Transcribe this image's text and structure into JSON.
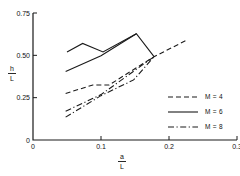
{
  "chart_data": {
    "type": "line",
    "title": "",
    "xlabel": "a/L",
    "ylabel": "h/L",
    "xlabel_num": "a",
    "xlabel_den": "L",
    "ylabel_num": "h",
    "ylabel_den": "L",
    "xlim": [
      0,
      0.3
    ],
    "ylim": [
      0,
      0.75
    ],
    "xticks": [
      0,
      0.1,
      0.2,
      0.3
    ],
    "xticklabels": [
      "0",
      "0.1",
      "0.2",
      "0.3"
    ],
    "yticks": [
      0,
      0.25,
      0.5,
      0.75
    ],
    "yticklabels": [
      "0",
      "0.25",
      "0.50",
      "0.75"
    ],
    "grid": false,
    "legend_position": "lower-right",
    "legend": [
      {
        "label": "M = 4",
        "style": "dashed"
      },
      {
        "label": "M = 6",
        "style": "solid"
      },
      {
        "label": "M = 8",
        "style": "dashdot"
      }
    ],
    "series": [
      {
        "name": "M = 4",
        "style": "dashed",
        "points": [
          [
            0.048,
            0.275
          ],
          [
            0.088,
            0.325
          ],
          [
            0.112,
            0.325
          ],
          [
            0.178,
            0.492
          ],
          [
            0.227,
            0.592
          ]
        ]
      },
      {
        "name": "M = 6 upper",
        "style": "solid",
        "points": [
          [
            0.05,
            0.52
          ],
          [
            0.073,
            0.57
          ],
          [
            0.103,
            0.52
          ],
          [
            0.152,
            0.628
          ],
          [
            0.178,
            0.492
          ]
        ]
      },
      {
        "name": "M = 6 lower",
        "style": "solid",
        "points": [
          [
            0.048,
            0.405
          ],
          [
            0.1,
            0.497
          ],
          [
            0.152,
            0.628
          ]
        ]
      },
      {
        "name": "M = 8 upper",
        "style": "dashdot",
        "points": [
          [
            0.048,
            0.17
          ],
          [
            0.1,
            0.268
          ],
          [
            0.178,
            0.492
          ]
        ]
      },
      {
        "name": "M = 8 lower",
        "style": "dashdot",
        "points": [
          [
            0.048,
            0.135
          ],
          [
            0.1,
            0.262
          ],
          [
            0.148,
            0.355
          ],
          [
            0.178,
            0.492
          ]
        ]
      }
    ]
  }
}
